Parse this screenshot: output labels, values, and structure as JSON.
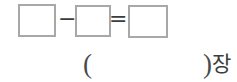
{
  "equation": {
    "minus_sign": "−",
    "equals_sign": "=",
    "boxes": {
      "minuend": "",
      "subtrahend": "",
      "result": ""
    }
  },
  "answer_line": {
    "open_paren": "(",
    "close_paren": ")",
    "unit_label": "장"
  },
  "colors": {
    "background": "#ffffff",
    "box_border": "#a8a8a8",
    "ink": "#3c3c3c"
  }
}
